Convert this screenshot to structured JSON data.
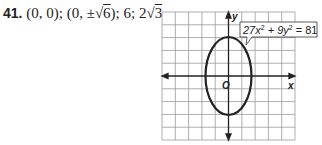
{
  "problem": {
    "number": "41.",
    "center": "(0, 0);",
    "vertices_prefix": "(0, ±",
    "vertices_radicand": "6",
    "vertices_suffix": ");",
    "major_axis": "6;",
    "minor_prefix": "2",
    "minor_radicand": "3"
  },
  "graph": {
    "x_label": "x",
    "y_label": "y",
    "origin_label": "O",
    "equation_label": {
      "base1": "27x",
      "exp1": "2",
      "mid": " + 9y",
      "exp2": "2",
      "end": " = 81"
    }
  }
}
